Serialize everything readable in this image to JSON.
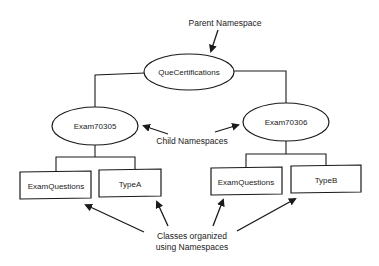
{
  "diagram": {
    "labels": {
      "parent": "Parent Namespace",
      "child": "Child Namespaces",
      "classes_line1": "Classes organized",
      "classes_line2": "using Namespaces"
    },
    "root": {
      "label": "QueCertifications",
      "shape": "ellipse"
    },
    "children": [
      {
        "label": "Exam70305",
        "shape": "ellipse",
        "classes": [
          {
            "label": "ExamQuestions",
            "shape": "rectangle"
          },
          {
            "label": "TypeA",
            "shape": "rectangle"
          }
        ]
      },
      {
        "label": "Exam70306",
        "shape": "ellipse",
        "classes": [
          {
            "label": "ExamQuestions",
            "shape": "rectangle"
          },
          {
            "label": "TypeB",
            "shape": "rectangle"
          }
        ]
      }
    ],
    "colors": {
      "stroke": "#1a1a1a",
      "text": "#222222",
      "background": "#ffffff"
    }
  }
}
